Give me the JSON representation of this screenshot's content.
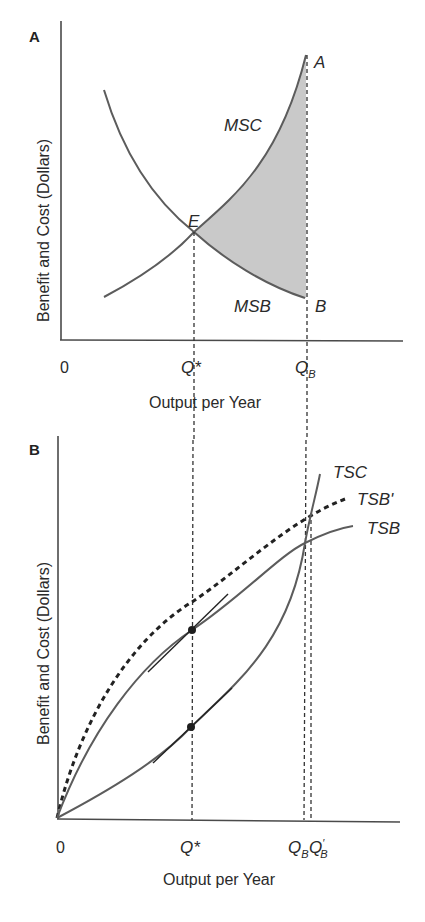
{
  "panels": {
    "a": {
      "label": "A",
      "y_axis_label": "Benefit and Cost (Dollars)",
      "x_axis_label": "Output per Year",
      "origin_label": "0",
      "tick_qstar": "Q*",
      "tick_qb_main": "Q",
      "tick_qb_sub": "B",
      "curve_msc": "MSC",
      "curve_msb": "MSB",
      "point_e": "E",
      "point_a": "A",
      "point_b": "B"
    },
    "b": {
      "label": "B",
      "y_axis_label": "Benefit and Cost (Dollars)",
      "x_axis_label": "Output per Year",
      "origin_label": "0",
      "tick_qstar": "Q*",
      "tick_qb_main": "Q",
      "tick_qb_sub": "B",
      "tick_qbp_main": "Q",
      "tick_qbp_prime": "′",
      "tick_qbp_sub": "B",
      "curve_tsc": "TSC",
      "curve_tsb_prime": "TSB'",
      "curve_tsb": "TSB"
    }
  },
  "colors": {
    "curve": "#5c5c5c",
    "shade": "#c9c9c9",
    "axis": "#4a4a4a"
  }
}
